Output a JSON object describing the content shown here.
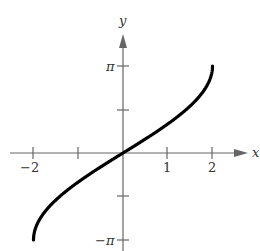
{
  "chart_data": {
    "type": "line",
    "title": "",
    "xlabel": "x",
    "ylabel": "y",
    "function": "y = 2 arcsin(x/2)",
    "xlim": [
      -2,
      2
    ],
    "ylim": [
      -3.14159,
      3.14159
    ],
    "x_ticks": [
      -2,
      -1,
      1,
      2
    ],
    "x_tick_labels": [
      "−2",
      "",
      "1",
      "2"
    ],
    "y_ticks": [
      3.14159,
      1.5708,
      -1.5708,
      -3.14159
    ],
    "y_tick_labels": [
      "π",
      "",
      "",
      "−π"
    ],
    "grid": false,
    "legend": null,
    "series": [
      {
        "name": "curve",
        "x": [
          -2,
          -1.9,
          -1.75,
          -1.5,
          -1.25,
          -1,
          -0.5,
          0,
          0.5,
          1,
          1.25,
          1.5,
          1.75,
          1.9,
          2
        ],
        "values": [
          -3.1416,
          -2.5018,
          -2.1268,
          -1.6961,
          -1.3467,
          -1.0472,
          -0.5054,
          0,
          0.5054,
          1.0472,
          1.3467,
          1.6961,
          2.1268,
          2.5018,
          3.1416
        ]
      }
    ]
  },
  "labels": {
    "x_axis": "x",
    "y_axis": "y",
    "pi": "π",
    "neg_pi": "−π",
    "neg_two": "−2",
    "one": "1",
    "two": "2"
  }
}
